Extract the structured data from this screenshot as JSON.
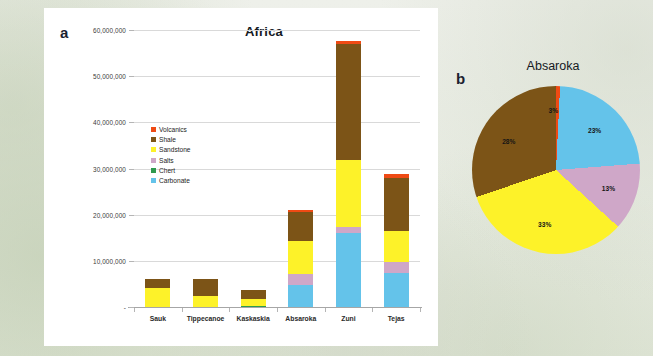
{
  "figure": {
    "panel_a_label": "a",
    "panel_b_label": "b"
  },
  "colors": {
    "volcanics": "#ef4a14",
    "shale": "#7c5417",
    "sandstone": "#fdf229",
    "salts": "#cfa7c8",
    "chert": "#2f9a4e",
    "carbonate": "#64c3ea",
    "gridline": "#d9d9d9",
    "axis": "#a6a6a6",
    "text": "#1d1d1d"
  },
  "legend": {
    "items": [
      {
        "label": "Volcanics",
        "color_key": "volcanics"
      },
      {
        "label": "Shale",
        "color_key": "shale"
      },
      {
        "label": "Sandstone",
        "color_key": "sandstone"
      },
      {
        "label": "Salts",
        "color_key": "salts"
      },
      {
        "label": "Chert",
        "color_key": "chert"
      },
      {
        "label": "Carbonate",
        "color_key": "carbonate"
      }
    ]
  },
  "chart_data": [
    {
      "id": "bar-chart",
      "type": "bar",
      "stacked": true,
      "title": "Africa",
      "xlabel": "",
      "ylabel": "",
      "ylim": [
        0,
        60000000
      ],
      "grid": true,
      "legend_position": "inside-upper-left",
      "categories": [
        "Sauk",
        "Tippecanoe",
        "Kaskaskia",
        "Absaroka",
        "Zuni",
        "Tejas"
      ],
      "ytick_labels": [
        "-",
        "10,000,000",
        "20,000,000",
        "30,000,000",
        "40,000,000",
        "50,000,000",
        "60,000,000"
      ],
      "ytick_values": [
        0,
        10000000,
        20000000,
        30000000,
        40000000,
        50000000,
        60000000
      ],
      "series": [
        {
          "name": "Carbonate",
          "color_key": "carbonate",
          "values": [
            0,
            0,
            0,
            4800000,
            16000000,
            7400000
          ]
        },
        {
          "name": "Chert",
          "color_key": "chert",
          "values": [
            0,
            0,
            300000,
            0,
            0,
            0
          ]
        },
        {
          "name": "Salts",
          "color_key": "salts",
          "values": [
            0,
            0,
            0,
            2400000,
            1300000,
            2400000
          ]
        },
        {
          "name": "Sandstone",
          "color_key": "sandstone",
          "values": [
            4200000,
            2400000,
            1500000,
            7200000,
            14500000,
            6700000
          ]
        },
        {
          "name": "Shale",
          "color_key": "shale",
          "values": [
            1900000,
            3700000,
            1900000,
            6200000,
            25200000,
            11400000
          ]
        },
        {
          "name": "Volcanics",
          "color_key": "volcanics",
          "values": [
            0,
            0,
            0,
            500000,
            600000,
            1000000
          ]
        }
      ],
      "totals": [
        6100000,
        6100000,
        3700000,
        21100000,
        57600000,
        28900000
      ]
    },
    {
      "id": "pie-chart",
      "type": "pie",
      "title": "Absaroka",
      "labels": [
        "Volcanics",
        "Carbonate",
        "Salts",
        "Sandstone",
        "Shale"
      ],
      "values": [
        3,
        23,
        13,
        33,
        28
      ],
      "value_labels": [
        "3%",
        "23%",
        "13%",
        "33%",
        "28%"
      ],
      "color_keys": [
        "volcanics",
        "carbonate",
        "salts",
        "sandstone",
        "shale"
      ],
      "start_angle_deg": -8
    }
  ]
}
